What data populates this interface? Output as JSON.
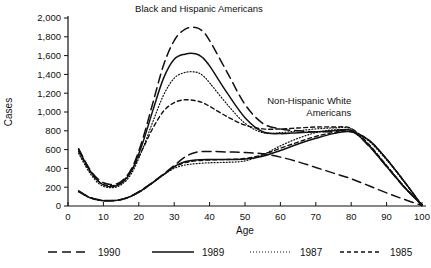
{
  "chart_data": {
    "type": "line",
    "title": "",
    "xlabel": "Age",
    "ylabel": "Cases",
    "xlim": [
      0,
      100
    ],
    "ylim": [
      0,
      2000
    ],
    "grid": false,
    "xticks": [
      0,
      10,
      20,
      30,
      40,
      50,
      60,
      70,
      80,
      90,
      100
    ],
    "xtick_labels": [
      "0",
      "10",
      "20",
      "30",
      "40",
      "50",
      "60",
      "70",
      "80",
      "90",
      "100"
    ],
    "yticks": [
      0,
      200,
      400,
      600,
      800,
      1000,
      1200,
      1400,
      1600,
      1800,
      2000
    ],
    "ytick_labels": [
      "0",
      "200",
      "400",
      "600",
      "800",
      "1,000",
      "1,200",
      "1,400",
      "1,600",
      "1,800",
      "2,000"
    ],
    "legend_position": "bottom",
    "annotations": [
      {
        "name": "black-hispanic-annotation",
        "lines": [
          "Black and Hispanic Americans"
        ],
        "x": 37,
        "y": 2060,
        "align": "middle"
      },
      {
        "name": "non-hispanic-white-annotation",
        "lines": [
          "Non-Hispanic White",
          "Americans"
        ],
        "x": 80,
        "y": 1080,
        "align": "end"
      }
    ],
    "groups": [
      {
        "name": "Black and Hispanic Americans",
        "series": [
          {
            "name": "1990",
            "style": "long-dash",
            "x": [
              3,
              6,
              9,
              12,
              15,
              18,
              21,
              24,
              27,
              30,
              33,
              36,
              38,
              40,
              45,
              50,
              55,
              60,
              65,
              70,
              75,
              80,
              85,
              90,
              95,
              100
            ],
            "values": [
              610,
              400,
              270,
              230,
              260,
              400,
              700,
              1100,
              1500,
              1760,
              1880,
              1900,
              1860,
              1760,
              1420,
              1080,
              880,
              820,
              800,
              790,
              790,
              800,
              640,
              420,
              200,
              10
            ]
          },
          {
            "name": "1989",
            "style": "solid",
            "x": [
              3,
              6,
              9,
              12,
              15,
              18,
              21,
              24,
              27,
              30,
              33,
              36,
              38,
              40,
              45,
              50,
              55,
              60,
              65,
              70,
              75,
              80,
              85,
              90,
              95,
              100
            ],
            "values": [
              600,
              390,
              250,
              205,
              240,
              380,
              660,
              1020,
              1360,
              1560,
              1615,
              1620,
              1580,
              1490,
              1200,
              940,
              790,
              770,
              780,
              790,
              800,
              805,
              640,
              420,
              200,
              10
            ]
          },
          {
            "name": "1987",
            "style": "fine-dot",
            "x": [
              3,
              6,
              9,
              12,
              15,
              18,
              21,
              24,
              27,
              30,
              33,
              36,
              38,
              40,
              45,
              50,
              55,
              60,
              65,
              70,
              75,
              80,
              85,
              90,
              95,
              100
            ],
            "values": [
              560,
              360,
              230,
              195,
              225,
              350,
              600,
              900,
              1180,
              1360,
              1420,
              1425,
              1390,
              1310,
              1080,
              880,
              780,
              780,
              800,
              820,
              830,
              820,
              650,
              430,
              205,
              10
            ]
          },
          {
            "name": "1985",
            "style": "dash-dot",
            "x": [
              3,
              6,
              9,
              12,
              15,
              18,
              21,
              24,
              27,
              30,
              33,
              36,
              38,
              40,
              45,
              50,
              55,
              60,
              65,
              70,
              75,
              80,
              85,
              90,
              95,
              100
            ],
            "values": [
              580,
              380,
              250,
              215,
              250,
              380,
              600,
              830,
              1010,
              1100,
              1130,
              1120,
              1100,
              1060,
              950,
              860,
              820,
              820,
              830,
              840,
              840,
              825,
              655,
              430,
              205,
              10
            ]
          }
        ]
      },
      {
        "name": "Non-Hispanic White Americans",
        "series": [
          {
            "name": "1990",
            "style": "long-dash",
            "x": [
              3,
              6,
              9,
              12,
              15,
              18,
              21,
              24,
              27,
              30,
              33,
              36,
              40,
              45,
              50,
              55,
              60,
              65,
              70,
              75,
              80,
              85,
              90,
              95,
              100
            ],
            "values": [
              160,
              95,
              65,
              58,
              70,
              110,
              175,
              255,
              340,
              430,
              520,
              570,
              580,
              575,
              570,
              555,
              520,
              470,
              410,
              350,
              290,
              215,
              140,
              70,
              5
            ]
          },
          {
            "name": "1989",
            "style": "solid",
            "x": [
              3,
              6,
              9,
              12,
              15,
              18,
              21,
              24,
              27,
              30,
              33,
              36,
              40,
              45,
              50,
              55,
              60,
              65,
              70,
              75,
              80,
              85,
              90,
              95,
              100
            ],
            "values": [
              155,
              92,
              62,
              55,
              68,
              108,
              172,
              252,
              335,
              420,
              470,
              490,
              495,
              495,
              500,
              530,
              590,
              660,
              720,
              770,
              790,
              700,
              500,
              260,
              5
            ]
          },
          {
            "name": "1987",
            "style": "fine-dot",
            "x": [
              3,
              6,
              9,
              12,
              15,
              18,
              21,
              24,
              27,
              30,
              33,
              36,
              40,
              45,
              50,
              55,
              60,
              65,
              70,
              75,
              80,
              85,
              90,
              95,
              100
            ],
            "values": [
              150,
              90,
              60,
              54,
              66,
              105,
              168,
              248,
              330,
              400,
              435,
              450,
              460,
              465,
              480,
              545,
              640,
              720,
              780,
              810,
              800,
              690,
              490,
              255,
              5
            ]
          },
          {
            "name": "1985",
            "style": "dash-dot",
            "x": [
              3,
              6,
              9,
              12,
              15,
              18,
              21,
              24,
              27,
              30,
              33,
              36,
              40,
              45,
              50,
              55,
              60,
              65,
              70,
              75,
              80,
              85,
              90,
              95,
              100
            ],
            "values": [
              158,
              93,
              63,
              56,
              69,
              107,
              170,
              250,
              335,
              415,
              460,
              480,
              490,
              495,
              505,
              545,
              615,
              680,
              740,
              780,
              790,
              700,
              500,
              260,
              5
            ]
          }
        ]
      }
    ],
    "legend": [
      {
        "label": "1990",
        "style": "long-dash"
      },
      {
        "label": "1989",
        "style": "solid"
      },
      {
        "label": "1987",
        "style": "fine-dot"
      },
      {
        "label": "1985",
        "style": "dash-dot"
      }
    ],
    "colors": {
      "ink": "#111111",
      "background": "#ffffff"
    }
  }
}
